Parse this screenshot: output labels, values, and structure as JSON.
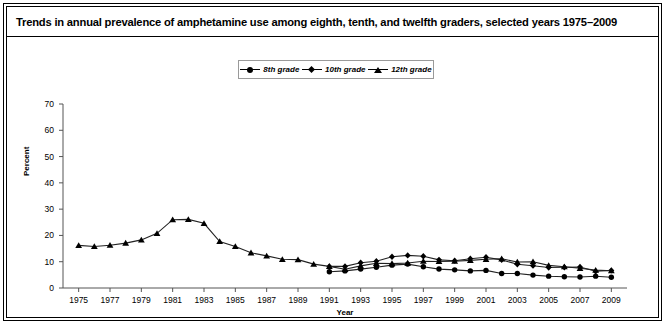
{
  "title": "Trends in annual prevalence of amphetamine use among eighth, tenth, and twelfth graders, selected years 1975–2009",
  "legend": {
    "items": [
      {
        "label": "8th grade",
        "marker": "circle-marker"
      },
      {
        "label": "10th grade",
        "marker": "diamond-marker"
      },
      {
        "label": "12th grade",
        "marker": "triangle-marker"
      }
    ]
  },
  "axes": {
    "ylabel": "Percent",
    "xlabel": "Year",
    "yticks": [
      "0",
      "10",
      "20",
      "30",
      "40",
      "50",
      "60",
      "70"
    ],
    "xticks": [
      "1975",
      "1977",
      "1979",
      "1981",
      "1983",
      "1985",
      "1987",
      "1989",
      "1991",
      "1993",
      "1995",
      "1997",
      "1999",
      "2001",
      "2003",
      "2005",
      "2007",
      "2009"
    ]
  },
  "chart_data": {
    "type": "line",
    "title": "Trends in annual prevalence of amphetamine use among eighth, tenth, and twelfth graders, selected years 1975–2009",
    "xlabel": "Year",
    "ylabel": "Percent",
    "xlim": [
      1974,
      2010
    ],
    "ylim": [
      0,
      70
    ],
    "grid": false,
    "legend_position": "top-center",
    "series": [
      {
        "name": "8th grade",
        "marker": "circle",
        "x": [
          1991,
          1992,
          1993,
          1994,
          1995,
          1996,
          1997,
          1998,
          1999,
          2000,
          2001,
          2002,
          2003,
          2004,
          2005,
          2006,
          2007,
          2008,
          2009
        ],
        "values": [
          6.2,
          6.5,
          7.2,
          7.9,
          8.7,
          9.1,
          8.1,
          7.2,
          6.9,
          6.5,
          6.7,
          5.5,
          5.5,
          4.9,
          4.5,
          4.3,
          4.2,
          4.5,
          4.1
        ]
      },
      {
        "name": "10th grade",
        "marker": "diamond",
        "x": [
          1991,
          1992,
          1993,
          1994,
          1995,
          1996,
          1997,
          1998,
          1999,
          2000,
          2001,
          2002,
          2003,
          2004,
          2005,
          2006,
          2007,
          2008,
          2009
        ],
        "values": [
          8.2,
          8.2,
          9.6,
          10.2,
          11.9,
          12.4,
          12.1,
          10.7,
          10.4,
          11.1,
          11.7,
          10.7,
          9.0,
          8.5,
          7.8,
          7.9,
          8.0,
          6.4,
          6.7
        ]
      },
      {
        "name": "12th grade",
        "marker": "triangle",
        "x": [
          1975,
          1976,
          1977,
          1978,
          1979,
          1980,
          1981,
          1982,
          1983,
          1984,
          1985,
          1986,
          1987,
          1988,
          1989,
          1990,
          1991,
          1992,
          1993,
          1994,
          1995,
          1996,
          1997,
          1998,
          1999,
          2000,
          2001,
          2002,
          2003,
          2004,
          2005,
          2006,
          2007,
          2008,
          2009
        ],
        "values": [
          16.2,
          15.8,
          16.3,
          17.1,
          18.3,
          20.8,
          26.0,
          26.1,
          24.6,
          17.7,
          15.8,
          13.4,
          12.2,
          10.9,
          10.8,
          9.1,
          8.2,
          7.1,
          8.4,
          9.4,
          9.3,
          9.5,
          10.2,
          10.1,
          10.2,
          10.5,
          10.9,
          11.1,
          9.9,
          10.0,
          8.6,
          8.1,
          7.5,
          6.8,
          6.6
        ]
      }
    ]
  }
}
